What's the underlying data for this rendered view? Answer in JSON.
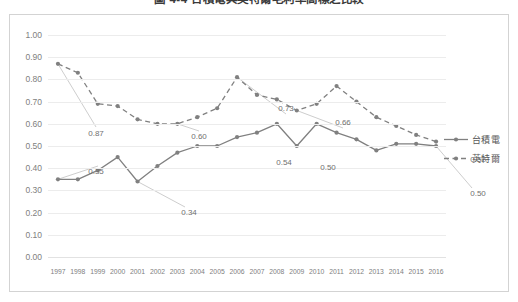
{
  "title": "圖 4-4  台積電與英特爾毛利率高標之比較",
  "chart_data": {
    "type": "line",
    "title": "圖 4-4  台積電與英特爾毛利率高標之比較",
    "xlabel": "",
    "ylabel": "",
    "ylim": [
      0.0,
      1.0
    ],
    "ytick_step": 0.1,
    "grid": "horizontal",
    "legend_position": "right",
    "categories": [
      "1997",
      "1998",
      "1999",
      "2000",
      "2001",
      "2002",
      "2003",
      "2004",
      "2005",
      "2006",
      "2007",
      "2008",
      "2009",
      "2010",
      "2011",
      "2012",
      "2013",
      "2014",
      "2015",
      "2016"
    ],
    "ytick_labels": [
      "0.00",
      "0.10",
      "0.20",
      "0.30",
      "0.40",
      "0.50",
      "0.60",
      "0.70",
      "0.80",
      "0.90",
      "1.00"
    ],
    "series": [
      {
        "name": "台積電",
        "style": "solid",
        "color": "#808080",
        "values": [
          0.35,
          0.35,
          0.39,
          0.45,
          0.34,
          0.41,
          0.47,
          0.5,
          0.5,
          0.54,
          0.56,
          0.6,
          0.5,
          0.6,
          0.56,
          0.53,
          0.48,
          0.51,
          0.51,
          0.5
        ],
        "labels": [
          {
            "category": "1997",
            "value": 0.35,
            "text": "0.35"
          },
          {
            "category": "2001",
            "value": 0.34,
            "text": "0.34"
          },
          {
            "category": "2006",
            "value": 0.54,
            "text": "0.54"
          },
          {
            "category": "2008",
            "value": 0.5,
            "text": "0.50"
          },
          {
            "category": "2016",
            "value": 0.5,
            "text": "0.50"
          }
        ]
      },
      {
        "name": "英特爾",
        "style": "dashed",
        "color": "#808080",
        "values": [
          0.87,
          0.83,
          0.69,
          0.68,
          0.62,
          0.6,
          0.6,
          0.63,
          0.67,
          0.81,
          0.73,
          0.71,
          0.66,
          0.69,
          0.77,
          0.7,
          0.63,
          0.59,
          0.55,
          0.52
        ],
        "labels": [
          {
            "category": "1997",
            "value": 0.87,
            "text": "0.87"
          },
          {
            "category": "2003",
            "value": 0.6,
            "text": "0.60"
          },
          {
            "category": "2006",
            "value": 0.73,
            "text": "0.73"
          },
          {
            "category": "2009",
            "value": 0.66,
            "text": "0.66"
          },
          {
            "category": "2016",
            "value": 0.52,
            "text": "0.52"
          }
        ]
      }
    ],
    "annotations": [
      {
        "text": "0.87",
        "series": "英特爾",
        "x": 48,
        "y": 98
      },
      {
        "text": "0.60",
        "series": "英特爾",
        "x": 151,
        "y": 101
      },
      {
        "text": "0.73",
        "series": "英特爾",
        "x": 238,
        "y": 73
      },
      {
        "text": "0.66",
        "series": "英特爾",
        "x": 295,
        "y": 87
      },
      {
        "text": "0.52",
        "series": "英特爾",
        "x": 430,
        "y": 124
      },
      {
        "text": "0.35",
        "series": "台積電",
        "x": 48,
        "y": 136
      },
      {
        "text": "0.34",
        "series": "台積電",
        "x": 141,
        "y": 177
      },
      {
        "text": "0.54",
        "series": "台積電",
        "x": 236,
        "y": 127
      },
      {
        "text": "0.50",
        "series": "台積電",
        "x": 280,
        "y": 132
      },
      {
        "text": "0.50",
        "series": "台積電",
        "x": 430,
        "y": 158
      }
    ]
  },
  "legend": {
    "items": [
      {
        "label": "台積電",
        "style": "solid"
      },
      {
        "label": "英特爾",
        "style": "dashed"
      }
    ]
  }
}
